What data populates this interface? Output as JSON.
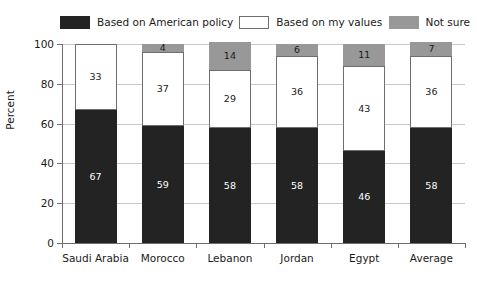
{
  "chart_data": {
    "type": "bar",
    "subtype": "stacked-bar",
    "title": "",
    "xlabel": "",
    "ylabel": "Percent",
    "ylim": [
      0,
      100
    ],
    "yticks": [
      0,
      20,
      40,
      60,
      80,
      100
    ],
    "grid": true,
    "legend_position": "top",
    "categories": [
      "Saudi Arabia",
      "Morocco",
      "Lebanon",
      "Jordan",
      "Egypt",
      "Average"
    ],
    "series": [
      {
        "name": "Based on American policy",
        "color": "#232323",
        "values": [
          67,
          59,
          58,
          58,
          46,
          58
        ]
      },
      {
        "name": "Based on my values",
        "color": "#ffffff",
        "values": [
          33,
          37,
          29,
          36,
          43,
          36
        ]
      },
      {
        "name": "Not sure",
        "color": "#989898",
        "values": [
          null,
          4,
          14,
          6,
          11,
          7
        ]
      }
    ]
  },
  "legend": {
    "items": [
      {
        "label": "Based on American policy",
        "swatch": "dark"
      },
      {
        "label": "Based on my values",
        "swatch": "white"
      },
      {
        "label": "Not sure",
        "swatch": "gray"
      }
    ]
  },
  "axis": {
    "y_label": "Percent",
    "y_ticks": [
      "100",
      "80",
      "60",
      "40",
      "20",
      "0"
    ]
  }
}
